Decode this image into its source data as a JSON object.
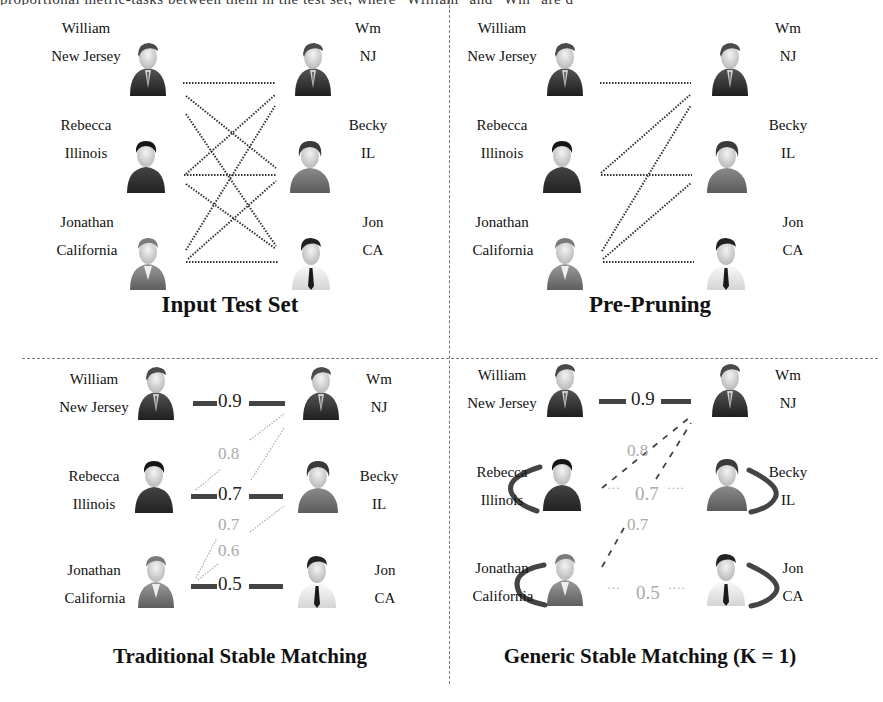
{
  "cropped_header_text": "proportional metric-tasks between them in the test set, where \"William\" and \"Wm\" are d",
  "colors": {
    "stable_edge": "#444444",
    "candidate_edge": "#999999",
    "faded_score": "#aaaaaa",
    "divider": "#777777"
  },
  "panels": [
    {
      "id": "input-test-set",
      "title": "Input Test Set",
      "left_people": [
        {
          "name": "William",
          "location": "New Jersey",
          "avatar": "suit-man"
        },
        {
          "name": "Rebecca",
          "location": "Illinois",
          "avatar": "dark-shirt-person"
        },
        {
          "name": "Jonathan",
          "location": "California",
          "avatar": "grey-suit-man"
        }
      ],
      "right_people": [
        {
          "name": "Wm",
          "location": "NJ",
          "avatar": "suit-man"
        },
        {
          "name": "Becky",
          "location": "IL",
          "avatar": "red-shirt-person"
        },
        {
          "name": "Jon",
          "location": "CA",
          "avatar": "tie-man"
        }
      ],
      "edges": "all 9 pairs dotted"
    },
    {
      "id": "pre-pruning",
      "title": "Pre-Pruning",
      "left_people": [
        {
          "name": "William",
          "location": "New Jersey"
        },
        {
          "name": "Rebecca",
          "location": "Illinois"
        },
        {
          "name": "Jonathan",
          "location": "California"
        }
      ],
      "right_people": [
        {
          "name": "Wm",
          "location": "NJ"
        },
        {
          "name": "Becky",
          "location": "IL"
        },
        {
          "name": "Jon",
          "location": "CA"
        }
      ],
      "edges": "William-Wm, Rebecca-Wm, Rebecca-Becky, Jonathan-Wm, Jonathan-Becky, Jonathan-Jon"
    },
    {
      "id": "traditional-stable-matching",
      "title": "Traditional Stable Matching",
      "left_people": [
        {
          "name": "William",
          "location": "New Jersey"
        },
        {
          "name": "Rebecca",
          "location": "Illinois"
        },
        {
          "name": "Jonathan",
          "location": "California"
        }
      ],
      "right_people": [
        {
          "name": "Wm",
          "location": "NJ"
        },
        {
          "name": "Becky",
          "location": "IL"
        },
        {
          "name": "Jon",
          "location": "CA"
        }
      ],
      "matched_scores": [
        "0.9",
        "0.7",
        "0.5"
      ],
      "candidate_scores": [
        "0.8",
        "0.7",
        "0.6"
      ]
    },
    {
      "id": "generic-stable-matching",
      "title": "Generic Stable Matching (K = 1)",
      "left_people": [
        {
          "name": "William",
          "location": "New Jersey"
        },
        {
          "name": "Rebecca",
          "location": "Illinois"
        },
        {
          "name": "Jonathan",
          "location": "California"
        }
      ],
      "right_people": [
        {
          "name": "Wm",
          "location": "NJ"
        },
        {
          "name": "Becky",
          "location": "IL"
        },
        {
          "name": "Jon",
          "location": "CA"
        }
      ],
      "matched_scores": [
        "0.9"
      ],
      "unmatched_scores": [
        "0.7",
        "0.5"
      ],
      "candidate_scores": [
        "0.8",
        "0.7"
      ]
    }
  ]
}
